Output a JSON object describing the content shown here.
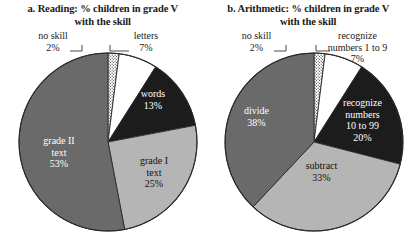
{
  "figure": {
    "background_color": "#ffffff",
    "panels": [
      {
        "id": "reading",
        "title": "a. Reading: % children in grade V\nwith the skill",
        "chart_geometry": {
          "cx": 108,
          "cy": 142,
          "r": 89
        },
        "callouts": [
          {
            "name": "no-skill",
            "text": "no skill\n2%",
            "x": 22,
            "y": 30,
            "width": 62
          },
          {
            "name": "letters",
            "text": "letters\n7%",
            "x": 118,
            "y": 30,
            "width": 56
          }
        ],
        "slice_labels": [
          {
            "name": "words",
            "text": "words\n13%",
            "x": 122,
            "y": 88,
            "width": 62,
            "tone": "on-dark"
          },
          {
            "name": "grade-i-text",
            "text": "grade I\ntext\n25%",
            "x": 124,
            "y": 155,
            "width": 60,
            "tone": "on-light"
          },
          {
            "name": "grade-ii-text",
            "text": "grade II\ntext\n53%",
            "x": 28,
            "y": 135,
            "width": 62,
            "tone": "on-dark"
          }
        ]
      },
      {
        "id": "arithmetic",
        "title": "b. Arithmetic: % children in grade V\nwith the skill",
        "chart_geometry": {
          "cx": 108,
          "cy": 142,
          "r": 89
        },
        "callouts": [
          {
            "name": "no-skill",
            "text": "no skill\n2%",
            "x": 20,
            "y": 30,
            "width": 62
          },
          {
            "name": "recognize-numbers-1-to-9",
            "text": "recognize\nnumbers 1 to 9\n7%",
            "x": 104,
            "y": 30,
            "width": 96
          }
        ],
        "slice_labels": [
          {
            "name": "recognize-numbers-10-to-99",
            "text": "recognize\nnumbers\n10 to 99\n20%",
            "x": 117,
            "y": 97,
            "width": 80,
            "tone": "on-dark"
          },
          {
            "name": "subtract",
            "text": "subtract\n33%",
            "x": 83,
            "y": 160,
            "width": 66,
            "tone": "on-light"
          },
          {
            "name": "divide",
            "text": "divide\n38%",
            "x": 20,
            "y": 105,
            "width": 62,
            "tone": "on-dark"
          }
        ]
      }
    ]
  },
  "palette": {
    "dotted": "#ffffff",
    "white": "#ffffff",
    "black": "#1c1c1c",
    "light_gray": "#b5b5b5",
    "dark_gray": "#6a6a6a",
    "outline": "#2a2a2a",
    "leader": "#4a4a4a"
  },
  "chart_data": [
    {
      "type": "pie",
      "id": "reading",
      "title": "a. Reading: % children in grade V with the skill",
      "unit": "%",
      "start_angle_deg": 0,
      "direction": "clockwise",
      "legend": "none",
      "categories": [
        "no skill",
        "letters",
        "words",
        "grade I text",
        "grade II text"
      ],
      "values": [
        2,
        7,
        13,
        25,
        53
      ],
      "colors": [
        "#ffffff",
        "#ffffff",
        "#1c1c1c",
        "#b5b5b5",
        "#6a6a6a"
      ],
      "patterns": [
        "dotted",
        "solid",
        "solid",
        "solid",
        "solid"
      ],
      "label_placement": [
        "callout",
        "callout",
        "inside",
        "inside",
        "inside"
      ]
    },
    {
      "type": "pie",
      "id": "arithmetic",
      "title": "b. Arithmetic: % children in grade V with the skill",
      "unit": "%",
      "start_angle_deg": 0,
      "direction": "clockwise",
      "legend": "none",
      "categories": [
        "no skill",
        "recognize numbers 1 to 9",
        "recognize numbers 10 to 99",
        "subtract",
        "divide"
      ],
      "values": [
        2,
        7,
        20,
        33,
        38
      ],
      "colors": [
        "#ffffff",
        "#ffffff",
        "#1c1c1c",
        "#b5b5b5",
        "#6a6a6a"
      ],
      "patterns": [
        "dotted",
        "solid",
        "solid",
        "solid",
        "solid"
      ],
      "label_placement": [
        "callout",
        "callout",
        "inside",
        "inside",
        "inside"
      ]
    }
  ]
}
